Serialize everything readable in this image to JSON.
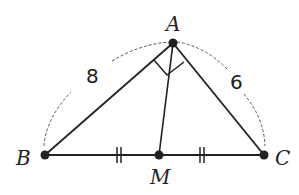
{
  "figure": {
    "type": "geometry-diagram",
    "points": {
      "A": {
        "label": "A",
        "x": 173,
        "y": 43
      },
      "B": {
        "label": "B",
        "x": 45,
        "y": 155
      },
      "C": {
        "label": "C",
        "x": 264,
        "y": 155
      },
      "M": {
        "label": "M",
        "x": 159,
        "y": 155
      }
    },
    "segments": [
      {
        "from": "A",
        "to": "B",
        "length_label": "8"
      },
      {
        "from": "A",
        "to": "C",
        "length_label": "6"
      },
      {
        "from": "B",
        "to": "C"
      },
      {
        "from": "A",
        "to": "M"
      }
    ],
    "marks": {
      "right_angle_at": "A",
      "equal_ticks": [
        "BM",
        "MC"
      ]
    },
    "labels": {
      "A": "A",
      "B": "B",
      "C": "C",
      "M": "M",
      "AB": "8",
      "AC": "6"
    },
    "colors": {
      "stroke": "#222222",
      "dashed": "#555555",
      "background": "#ffffff"
    }
  }
}
